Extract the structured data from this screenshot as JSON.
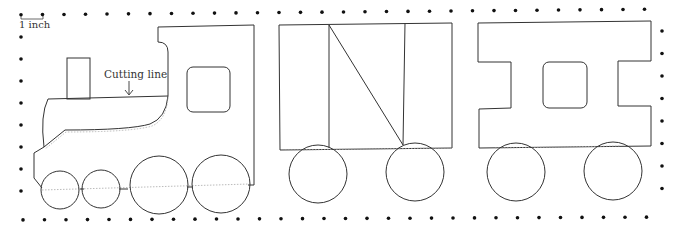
{
  "scale": {
    "label": "1 inch"
  },
  "annotation": {
    "label": "Cutting line"
  },
  "pieces": [
    {
      "name": "engine",
      "wheels": 4,
      "window": "rounded-square"
    },
    {
      "name": "boxcar",
      "wheels": 2,
      "panels": 3,
      "diagonal_brace": true
    },
    {
      "name": "caboose",
      "wheels": 2,
      "window": "rounded-square",
      "shape": "I-beam"
    }
  ],
  "colors": {
    "outline": "#333333",
    "dot": "#111111",
    "dotted_line": "#999999"
  },
  "dot_grid": {
    "spacing": 22,
    "border": "dotted-rectangle"
  }
}
